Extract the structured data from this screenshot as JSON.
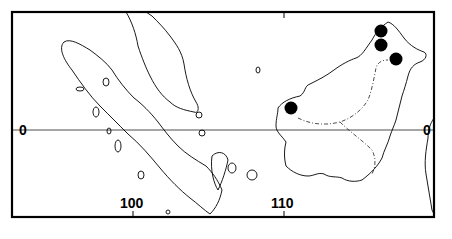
{
  "map": {
    "frame": {
      "x": 12,
      "y": 12,
      "width": 422,
      "height": 205
    },
    "equator": {
      "label_left": "0",
      "label_right": "0",
      "y": 130
    },
    "longitude_labels": [
      {
        "label": "100",
        "x": 133
      },
      {
        "label": "110",
        "x": 284
      }
    ],
    "regions": [
      "Sumatra",
      "Malay Peninsula",
      "Borneo"
    ],
    "points": [
      {
        "name": "occurrence-1",
        "x": 381,
        "y": 31
      },
      {
        "name": "occurrence-2",
        "x": 381,
        "y": 45
      },
      {
        "name": "occurrence-3",
        "x": 396,
        "y": 59
      },
      {
        "name": "occurrence-4",
        "x": 291,
        "y": 108
      }
    ],
    "colors": {
      "ink": "#000000",
      "background": "#ffffff"
    }
  }
}
